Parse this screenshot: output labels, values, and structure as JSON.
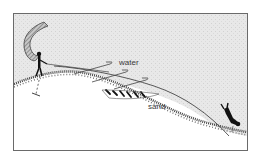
{
  "diagram": {
    "labels": {
      "water": "water",
      "sand": "sand"
    },
    "elements": [
      {
        "name": "breaking-wave",
        "description": "curved hatched wave on the left"
      },
      {
        "name": "person-standing",
        "description": "figure standing at shoreline holding a line/rope"
      },
      {
        "name": "anchor-line",
        "description": "dashed line extending down into the ground from standing person"
      },
      {
        "name": "current-arrows-surface",
        "description": "three flat arrow shapes in the water layer"
      },
      {
        "name": "current-arrows-bottom",
        "description": "row of short dark hatch marks in the sand wedge"
      },
      {
        "name": "seabed-profile",
        "description": "hatched sloping seabed line"
      },
      {
        "name": "diver",
        "description": "diver figure at lower right near seabed"
      }
    ],
    "colors": {
      "water_bg": "#e6e6e6",
      "ink": "#1e1e1e",
      "frame": "#6a6a6a"
    }
  }
}
